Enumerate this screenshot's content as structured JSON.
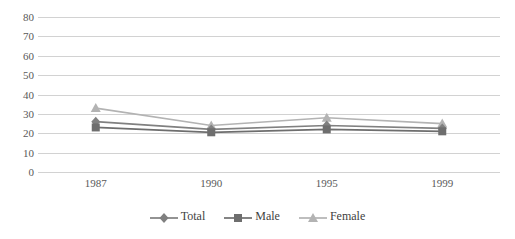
{
  "chart_data": {
    "type": "line",
    "title": "",
    "subtitle": "",
    "xlabel": "",
    "ylabel": "",
    "categories": [
      "1987",
      "1990",
      "1995",
      "1999"
    ],
    "series": [
      {
        "name": "Total",
        "marker": "diamond",
        "color": "#808080",
        "values": [
          26,
          22,
          24,
          22.5
        ]
      },
      {
        "name": "Male",
        "marker": "square",
        "color": "#6E6E6E",
        "values": [
          23,
          20.5,
          22,
          21
        ]
      },
      {
        "name": "Female",
        "marker": "triangle",
        "color": "#B3B3B3",
        "values": [
          33,
          24,
          28,
          25
        ]
      }
    ],
    "yticks": [
      0,
      10,
      20,
      30,
      40,
      50,
      60,
      70,
      80
    ],
    "ylim": [
      0,
      80
    ],
    "grid": true,
    "grid_color": "#D2D2D2",
    "legend_position": "bottom",
    "background": "#FFFFFF"
  },
  "legend": {
    "items": [
      {
        "label": "Total"
      },
      {
        "label": "Male"
      },
      {
        "label": "Female"
      }
    ]
  }
}
